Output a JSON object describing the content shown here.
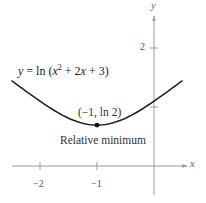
{
  "chart_data": {
    "type": "line",
    "title": "",
    "function": "y = ln (x^2 + 2x + 3)",
    "equation_label": {
      "prefix": "y = ln (x",
      "exponent": "2",
      "suffix": " + 2x + 3)"
    },
    "xlabel": "x",
    "ylabel": "y",
    "xlim": [
      -2.5,
      0.5
    ],
    "ylim": [
      0,
      2.5
    ],
    "x_ticks": [
      {
        "value": -2,
        "label": "−2"
      },
      {
        "value": -1,
        "label": "−1"
      }
    ],
    "y_ticks": [
      {
        "value": 1,
        "label": ""
      },
      {
        "value": 2,
        "label": "2"
      }
    ],
    "grid": false,
    "series": [
      {
        "name": "y = ln (x^2 + 2x + 3)",
        "x": [
          -2.5,
          -2.25,
          -2,
          -1.75,
          -1.5,
          -1.25,
          -1,
          -0.75,
          -0.5,
          -0.25,
          0,
          0.25,
          0.5
        ],
        "y": [
          1.447,
          1.271,
          1.099,
          0.941,
          0.811,
          0.724,
          0.693,
          0.724,
          0.811,
          0.941,
          1.099,
          1.271,
          1.447
        ]
      }
    ],
    "annotations": [
      {
        "point": [
          -1,
          0.693
        ],
        "label": "(−1, ln 2)"
      },
      {
        "text": "Relative minimum"
      }
    ]
  },
  "colors": {
    "curve": "#222222",
    "axis": "#9a9a9a",
    "point": "#111111",
    "text": "#333333"
  }
}
